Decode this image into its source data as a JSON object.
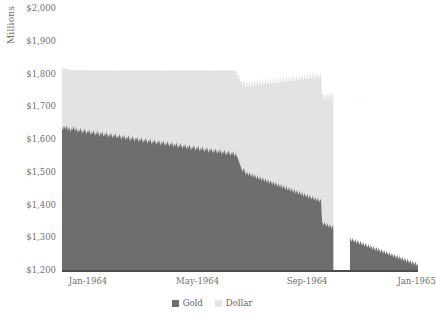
{
  "chart_data": {
    "type": "area",
    "stacked": true,
    "title": "",
    "subtitle": "",
    "xlabel": "",
    "ylabel": "Millions",
    "ylim": [
      1200,
      2000
    ],
    "ytick_labels": [
      "$2,000",
      "$1,900",
      "$1,800",
      "$1,700",
      "$1,600",
      "$1,500",
      "$1,400",
      "$1,300",
      "$1,200"
    ],
    "ytick_values": [
      2000,
      1900,
      1800,
      1700,
      1600,
      1500,
      1400,
      1300,
      1200
    ],
    "xtick_labels": [
      "Jan-1964",
      "May-1964",
      "Sep-1964",
      "Jan-1965"
    ],
    "xtick_positions": [
      0,
      0.3077,
      0.6154,
      0.9231
    ],
    "grid": false,
    "legend": {
      "position": "bottom-center",
      "entries": [
        {
          "name": "Gold",
          "color": "#6e6e6e"
        },
        {
          "name": "Dollar",
          "color": "#e3e3e3"
        }
      ]
    },
    "series": [
      {
        "name": "Gold",
        "color": "#6e6e6e",
        "values": [
          1632,
          1628,
          1640,
          1636,
          1630,
          1641,
          1634,
          1626,
          1638,
          1630,
          1621,
          1634,
          1627,
          1640,
          1632,
          1624,
          1636,
          1628,
          1618,
          1630,
          1622,
          1634,
          1626,
          1616,
          1628,
          1620,
          1632,
          1624,
          1614,
          1626,
          1618,
          1630,
          1621,
          1612,
          1624,
          1616,
          1628,
          1619,
          1610,
          1622,
          1614,
          1626,
          1617,
          1608,
          1620,
          1612,
          1624,
          1615,
          1606,
          1618,
          1610,
          1622,
          1613,
          1604,
          1616,
          1608,
          1620,
          1611,
          1602,
          1614,
          1606,
          1618,
          1609,
          1600,
          1612,
          1604,
          1616,
          1607,
          1598,
          1610,
          1602,
          1614,
          1605,
          1596,
          1608,
          1600,
          1612,
          1603,
          1594,
          1606,
          1598,
          1610,
          1601,
          1592,
          1604,
          1596,
          1608,
          1599,
          1590,
          1602,
          1594,
          1606,
          1597,
          1588,
          1600,
          1592,
          1604,
          1595,
          1586,
          1598,
          1590,
          1602,
          1593,
          1584,
          1596,
          1588,
          1600,
          1591,
          1582,
          1594,
          1586,
          1598,
          1589,
          1580,
          1592,
          1584,
          1596,
          1587,
          1578,
          1590,
          1582,
          1594,
          1585,
          1576,
          1588,
          1580,
          1592,
          1583,
          1574,
          1586,
          1578,
          1590,
          1581,
          1572,
          1584,
          1576,
          1588,
          1579,
          1570,
          1582,
          1574,
          1586,
          1577,
          1568,
          1580,
          1572,
          1584,
          1575,
          1566,
          1578,
          1570,
          1582,
          1573,
          1564,
          1576,
          1568,
          1580,
          1571,
          1562,
          1574,
          1566,
          1578,
          1569,
          1560,
          1572,
          1564,
          1576,
          1567,
          1558,
          1570,
          1562,
          1574,
          1565,
          1556,
          1568,
          1560,
          1572,
          1563,
          1554,
          1566,
          1558,
          1570,
          1561,
          1552,
          1564,
          1556,
          1568,
          1559,
          1550,
          1562,
          1554,
          1566,
          1557,
          1548,
          1560,
          1552,
          1564,
          1555,
          1546,
          1558,
          1550,
          1545,
          1538,
          1530,
          1522,
          1515,
          1508,
          1500,
          1512,
          1505,
          1497,
          1490,
          1502,
          1494,
          1487,
          1499,
          1491,
          1484,
          1496,
          1488,
          1481,
          1493,
          1485,
          1478,
          1490,
          1482,
          1475,
          1487,
          1479,
          1472,
          1484,
          1476,
          1469,
          1481,
          1473,
          1466,
          1478,
          1470,
          1463,
          1475,
          1467,
          1460,
          1472,
          1464,
          1457,
          1469,
          1461,
          1454,
          1466,
          1458,
          1451,
          1463,
          1455,
          1448,
          1460,
          1452,
          1445,
          1457,
          1449,
          1442,
          1454,
          1446,
          1439,
          1451,
          1443,
          1436,
          1448,
          1440,
          1433,
          1445,
          1437,
          1430,
          1442,
          1434,
          1427,
          1439,
          1431,
          1424,
          1436,
          1428,
          1421,
          1433,
          1425,
          1418,
          1430,
          1422,
          1415,
          1427,
          1419,
          1412,
          1424,
          1416,
          1409,
          1421,
          1413,
          1406,
          1418,
          1410,
          1350,
          1342,
          1335,
          1347,
          1339,
          1332,
          1344,
          1336,
          1329,
          1341,
          1333,
          1326,
          1338,
          1330,
          null,
          null,
          null,
          null,
          null,
          null,
          null,
          null,
          null,
          null,
          null,
          null,
          null,
          null,
          null,
          null,
          null,
          null,
          1300,
          1293,
          1286,
          1298,
          1290,
          1283,
          1295,
          1287,
          1280,
          1292,
          1284,
          1277,
          1289,
          1281,
          1274,
          1286,
          1278,
          1271,
          1283,
          1275,
          1268,
          1280,
          1272,
          1265,
          1277,
          1269,
          1262,
          1274,
          1266,
          1259,
          1271,
          1263,
          1256,
          1268,
          1260,
          1253,
          1265,
          1257,
          1250,
          1262,
          1254,
          1247,
          1259,
          1251,
          1244,
          1256,
          1248,
          1241,
          1253,
          1245,
          1238,
          1250,
          1242,
          1235,
          1247,
          1239,
          1232,
          1244,
          1236,
          1229,
          1241,
          1233,
          1226,
          1238,
          1230,
          1223,
          1235,
          1227,
          1220,
          1232,
          1224,
          1217,
          1229,
          1221,
          1214,
          1226,
          1218,
          1211,
          1223
        ]
      },
      {
        "name": "Dollar",
        "color": "#e3e3e3",
        "values": [
          188,
          184,
          176,
          180,
          186,
          172,
          178,
          186,
          174,
          182,
          190,
          176,
          184,
          170,
          178,
          186,
          174,
          182,
          192,
          180,
          188,
          176,
          184,
          194,
          182,
          190,
          178,
          186,
          196,
          184,
          192,
          180,
          188,
          198,
          186,
          194,
          182,
          190,
          200,
          188,
          196,
          184,
          192,
          202,
          190,
          198,
          186,
          194,
          204,
          192,
          200,
          188,
          196,
          206,
          194,
          202,
          190,
          198,
          208,
          196,
          204,
          192,
          200,
          210,
          198,
          206,
          194,
          202,
          212,
          200,
          208,
          196,
          204,
          214,
          202,
          210,
          198,
          206,
          216,
          204,
          212,
          200,
          208,
          218,
          206,
          214,
          202,
          210,
          220,
          208,
          216,
          204,
          212,
          222,
          210,
          218,
          206,
          214,
          224,
          212,
          220,
          208,
          216,
          226,
          214,
          222,
          210,
          218,
          228,
          216,
          224,
          212,
          220,
          230,
          218,
          226,
          214,
          222,
          232,
          220,
          228,
          216,
          224,
          234,
          222,
          230,
          218,
          226,
          236,
          224,
          232,
          220,
          228,
          238,
          226,
          234,
          222,
          230,
          240,
          228,
          236,
          224,
          232,
          242,
          230,
          238,
          226,
          234,
          244,
          232,
          240,
          228,
          236,
          246,
          234,
          242,
          230,
          238,
          248,
          236,
          244,
          232,
          240,
          250,
          238,
          246,
          234,
          242,
          252,
          240,
          248,
          236,
          244,
          254,
          242,
          250,
          238,
          246,
          256,
          244,
          252,
          240,
          248,
          258,
          246,
          254,
          242,
          250,
          260,
          248,
          256,
          244,
          252,
          262,
          250,
          258,
          246,
          254,
          264,
          252,
          260,
          250,
          258,
          266,
          254,
          262,
          270,
          258,
          266,
          274,
          262,
          270,
          278,
          266,
          274,
          282,
          270,
          278,
          286,
          274,
          282,
          290,
          278,
          286,
          294,
          282,
          290,
          298,
          286,
          294,
          302,
          290,
          298,
          306,
          294,
          302,
          310,
          298,
          306,
          314,
          302,
          310,
          318,
          306,
          314,
          322,
          310,
          318,
          326,
          314,
          322,
          330,
          318,
          326,
          334,
          322,
          330,
          338,
          326,
          334,
          342,
          330,
          338,
          346,
          334,
          342,
          350,
          338,
          346,
          354,
          342,
          350,
          358,
          346,
          354,
          362,
          350,
          358,
          366,
          354,
          362,
          370,
          358,
          366,
          374,
          362,
          370,
          378,
          366,
          374,
          382,
          370,
          378,
          386,
          374,
          382,
          390,
          378,
          386,
          394,
          382,
          390,
          398,
          386,
          394,
          402,
          390,
          398,
          406,
          394,
          402,
          410,
          398,
          406,
          414,
          402,
          410,
          418,
          406,
          414,
          422,
          410,
          418,
          426,
          414,
          422,
          430,
          418,
          426,
          434,
          422,
          430,
          438,
          426,
          434,
          442,
          430,
          438,
          446,
          434,
          442,
          450,
          438,
          446,
          454,
          442,
          450,
          458,
          446,
          454,
          462,
          450,
          458,
          466,
          454,
          462,
          470,
          458,
          466,
          474,
          462,
          470,
          478,
          466,
          474
        ]
      }
    ]
  }
}
